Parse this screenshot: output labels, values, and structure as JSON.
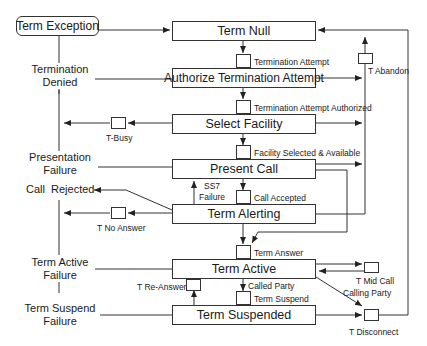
{
  "diagram": {
    "type": "state-machine",
    "exception_state": "Term Exception",
    "states": [
      {
        "id": "term_null",
        "label": "Term Null"
      },
      {
        "id": "authorize",
        "label": "Authorize Termination Attempt"
      },
      {
        "id": "select_facility",
        "label": "Select Facility"
      },
      {
        "id": "present_call",
        "label": "Present Call"
      },
      {
        "id": "term_alerting",
        "label": "Term Alerting"
      },
      {
        "id": "term_active",
        "label": "Term Active"
      },
      {
        "id": "term_suspended",
        "label": "Term Suspended"
      }
    ],
    "detection_points": {
      "termination_attempt": "Termination Attempt",
      "termination_attempt_authorized": "Termination Attempt Authorized",
      "facility_selected": "Facility Selected & Available",
      "call_accepted": "Call Accepted",
      "term_answer": "Term Answer",
      "term_suspend": "Term Suspend",
      "t_abandon": "T Abandon",
      "t_busy": "T-Busy",
      "t_no_answer": "T No Answer",
      "t_re_answer": "T Re-Answer",
      "t_mid_call": "T Mid Call",
      "calling_party": "Calling Party",
      "called_party": "Called Party",
      "t_disconnect": "T Disconnect",
      "ss7_failure_line1": "SS7",
      "ss7_failure_line2": "Failure"
    },
    "outcomes": {
      "termination_denied_1": "Termination",
      "termination_denied_2": "Denied",
      "presentation_failure_1": "Presentation",
      "presentation_failure_2": "Failure",
      "call_rejected": "Call  Rejected",
      "term_active_failure_1": "Term Active",
      "term_active_failure_2": "Failure",
      "term_suspend_failure_1": "Term Suspend",
      "term_suspend_failure_2": "Failure"
    },
    "colors": {
      "line": "#333333",
      "background": "#ffffff",
      "text": "#1a1a1a"
    }
  }
}
